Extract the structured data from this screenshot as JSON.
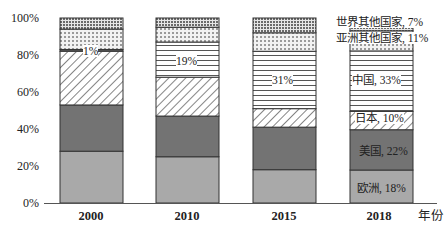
{
  "chart_data": {
    "type": "bar",
    "stacked": true,
    "percent": true,
    "title": "",
    "xlabel": "年份",
    "ylabel": "",
    "ylim": [
      0,
      100
    ],
    "yticks": [
      "0%",
      "20%",
      "40%",
      "60%",
      "80%",
      "100%"
    ],
    "categories": [
      "2000",
      "2010",
      "2015",
      "2018"
    ],
    "grid": false,
    "legend": "inline labels on 2018 bar",
    "series": [
      {
        "name": "欧洲",
        "pattern": "solid-light-gray",
        "color": "#a9a9a9",
        "values": [
          28,
          25,
          18,
          18
        ]
      },
      {
        "name": "美国",
        "pattern": "solid-dark-gray",
        "color": "#737373",
        "values": [
          25,
          22,
          23,
          22
        ]
      },
      {
        "name": "日本",
        "pattern": "diagonal-hatch",
        "color": "#ffffff",
        "values": [
          29,
          21,
          10,
          10
        ]
      },
      {
        "name": "中国",
        "pattern": "horizontal-lines",
        "color": "#ffffff",
        "values": [
          1,
          19,
          31,
          33
        ]
      },
      {
        "name": "亚洲其他国家",
        "pattern": "light-dots",
        "color": "#dcdcdc",
        "values": [
          11,
          8,
          10,
          11
        ]
      },
      {
        "name": "世界其他国家",
        "pattern": "dense-dots",
        "color": "#bdbdbd",
        "values": [
          6,
          5,
          8,
          7
        ]
      }
    ],
    "annotations": [
      {
        "category": "2000",
        "series": "中国",
        "text": "1%"
      },
      {
        "category": "2010",
        "series": "中国",
        "text": "19%"
      },
      {
        "category": "2015",
        "series": "中国",
        "text": "31%"
      },
      {
        "category": "2018",
        "series": "欧洲",
        "text": "欧洲, 18%"
      },
      {
        "category": "2018",
        "series": "美国",
        "text": "美国, 22%"
      },
      {
        "category": "2018",
        "series": "日本",
        "text": "日本, 10%"
      },
      {
        "category": "2018",
        "series": "中国",
        "text": "中国, 33%"
      },
      {
        "category": "2018",
        "series": "亚洲其他国家",
        "text": "亚洲其他国家, 11%"
      },
      {
        "category": "2018",
        "series": "世界其他国家",
        "text": "世界其他国家, 7%"
      }
    ]
  },
  "axis": {
    "y_ticks": [
      "100%",
      "80%",
      "60%",
      "40%",
      "20%",
      "0%"
    ],
    "x_ticks": [
      "2000",
      "2010",
      "2015",
      "2018"
    ],
    "x_label": "年份"
  },
  "labels": {
    "c2000_china": "1%",
    "c2010_china": "19%",
    "c2015_china": "31%",
    "c2018_europe": "欧洲, 18%",
    "c2018_us": "美国, 22%",
    "c2018_japan": "日本, 10%",
    "c2018_china": "中国, 33%",
    "c2018_asia_other": "亚洲其他国家, 11%",
    "c2018_world_other": "世界其他国家, 7%"
  }
}
